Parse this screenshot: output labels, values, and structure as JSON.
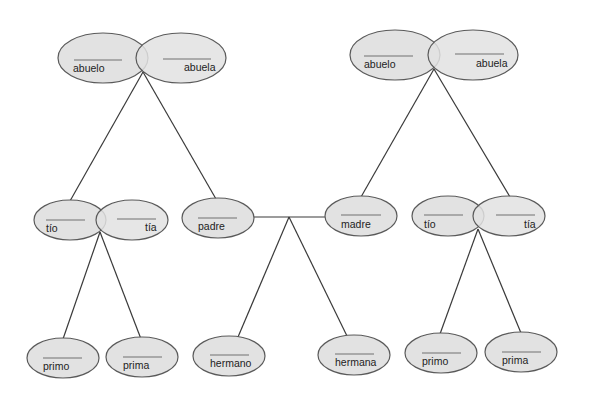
{
  "diagram": {
    "type": "family-tree",
    "colors": {
      "node_fill": "#e2e2e2",
      "node_stroke": "#5a5a5a",
      "edge": "#3a3a3a",
      "text": "#222222"
    },
    "couples": {
      "paternal_grandparents": {
        "left": "abuelo",
        "right": "abuela"
      },
      "maternal_grandparents": {
        "left": "abuelo",
        "right": "abuela"
      },
      "paternal_uncle_aunt": {
        "left": "tío",
        "right": "tía"
      },
      "maternal_uncle_aunt": {
        "left": "tío",
        "right": "tía"
      }
    },
    "parents": {
      "father": "padre",
      "mother": "madre"
    },
    "children": {
      "paternal_cousins": [
        "primo",
        "prima"
      ],
      "siblings": [
        "hermano",
        "hermana"
      ],
      "maternal_cousins": [
        "primo",
        "prima"
      ]
    }
  }
}
